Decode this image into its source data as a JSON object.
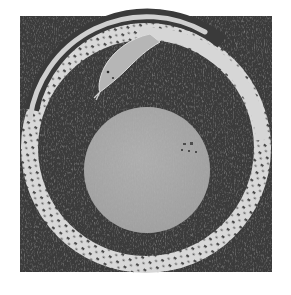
{
  "image": {
    "subject": "Ouroboros serpent encircling a pale disc on a dark textured ground",
    "alt": "Engraving-style image of a snake forming a circle around a round orb"
  },
  "colors": {
    "page_background": "#ffffff",
    "ground": "#3a3a3a",
    "ground_dark": "#2a2a2a",
    "serpent_body": "#d8d8d8",
    "serpent_scales": "#4a4a4a",
    "serpent_head": "#b4b4b4",
    "orb": "#a9a9a9",
    "orb_spots": "#4d4d4d"
  },
  "geometry": {
    "frame": {
      "x": 20,
      "y": 16,
      "width": 252,
      "height": 256
    },
    "ring": {
      "cx": 146,
      "cy": 148,
      "outer_r": 125,
      "inner_r": 108
    },
    "orb": {
      "cx": 147,
      "cy": 170,
      "r": 63
    }
  }
}
